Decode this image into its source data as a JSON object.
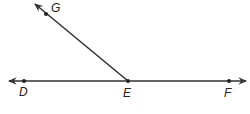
{
  "diagram": {
    "type": "geometry-rays",
    "stroke_color": "#333333",
    "points": [
      {
        "name": "G",
        "label": "G",
        "x": 46,
        "y": 14,
        "label_x": 51,
        "label_y": 12
      },
      {
        "name": "D",
        "label": "D",
        "x": 24,
        "y": 81,
        "label_x": 19,
        "label_y": 96
      },
      {
        "name": "E",
        "label": "E",
        "x": 128,
        "y": 81,
        "label_x": 123,
        "label_y": 97
      },
      {
        "name": "F",
        "label": "F",
        "x": 229,
        "y": 81,
        "label_x": 224,
        "label_y": 97
      }
    ],
    "labels": {
      "G": "G",
      "D": "D",
      "E": "E",
      "F": "F"
    },
    "elements": [
      {
        "type": "line",
        "name": "line-DF",
        "through": [
          "D",
          "E",
          "F"
        ],
        "arrows": "both"
      },
      {
        "type": "ray",
        "name": "ray-EG",
        "from": "E",
        "through": "G",
        "arrow": "end"
      }
    ]
  }
}
